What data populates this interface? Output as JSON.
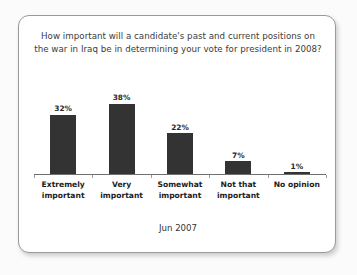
{
  "card": {
    "footer_date": "Jun 2007"
  },
  "chart_data": {
    "type": "bar",
    "title": "How important will a candidate's past and current positions on the war in Iraq be in determining your vote for president in 2008?",
    "xlabel": "",
    "ylabel": "",
    "ylim": [
      0,
      40
    ],
    "grid": false,
    "legend": "none",
    "categories": [
      "Extremely important",
      "Very important",
      "Somewhat important",
      "Not that important",
      "No opinion"
    ],
    "category_lines": [
      [
        "Extremely",
        "important"
      ],
      [
        "Very",
        "important"
      ],
      [
        "Somewhat",
        "important"
      ],
      [
        "Not that",
        "important"
      ],
      [
        "No opinion",
        ""
      ]
    ],
    "values": [
      32,
      38,
      22,
      7,
      1
    ],
    "value_labels": [
      "32%",
      "38%",
      "22%",
      "7%",
      "1%"
    ],
    "bar_color": "#333333",
    "annotation": "Jun 2007"
  }
}
